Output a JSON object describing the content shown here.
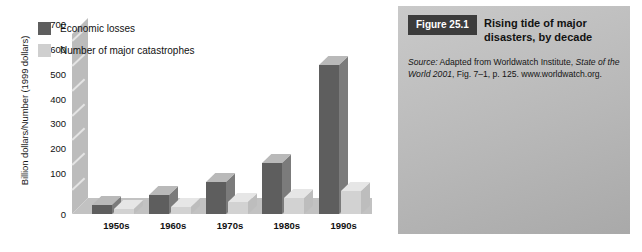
{
  "chart_data": {
    "type": "bar",
    "title": "Rising tide of major disasters, by decade",
    "xlabel": "",
    "ylabel": "Billion dollars/Number (1999 dollars)",
    "ylim": [
      0,
      700
    ],
    "yticks": [
      0,
      100,
      200,
      300,
      400,
      500,
      600,
      700
    ],
    "ytick_labels": [
      "0",
      "100",
      "200",
      "300",
      "400",
      "500",
      "600",
      "700"
    ],
    "grid": true,
    "legend_position": "upper-left-inside",
    "categories": [
      "1950s",
      "1960s",
      "1970s",
      "1980s",
      "1990s"
    ],
    "series": [
      {
        "name": "Economic losses",
        "color": "#5e5e5e",
        "values": [
          38,
          75,
          130,
          204,
          600
        ]
      },
      {
        "name": "Number of major catastrophes",
        "color": "#d2d2d2",
        "values": [
          20,
          27,
          47,
          63,
          91
        ]
      }
    ]
  },
  "chart": {
    "y_axis_title": "Billion dollars/Number (1999 dollars)",
    "legend": [
      {
        "label": "Economic losses",
        "swatch": "dark"
      },
      {
        "label": "Number of major catastrophes",
        "swatch": "light"
      }
    ]
  },
  "caption": {
    "badge": "Figure 25.1",
    "title": "Rising tide of major disasters, by decade",
    "source_prefix": "Source:",
    "source_line1_a": " Adapted from Worldwatch Institute, ",
    "source_line1_italic": "State of the World 2001",
    "source_line1_b": ", Fig. 7–1, p. 125.",
    "source_line2": "www.worldwatch.org."
  },
  "colors": {
    "economic_losses": "#5e5e5e",
    "catastrophes": "#d2d2d2",
    "plot_background": "#c6c6c6",
    "gridline": "#ffffff",
    "badge_background": "#3c3c3c",
    "caption_panel": "#bdbdbd"
  }
}
